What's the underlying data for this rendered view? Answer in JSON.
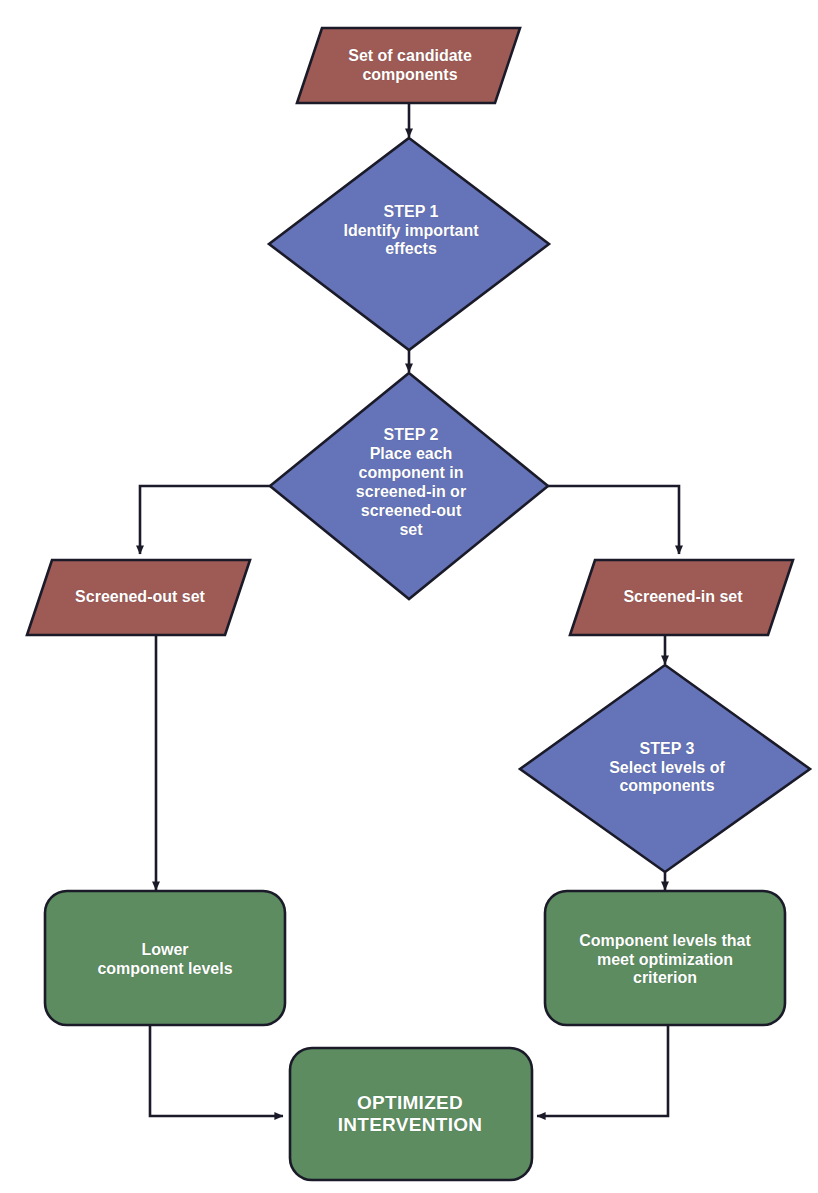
{
  "diagram": {
    "colors": {
      "red_fill": "#9e5a55",
      "blue_fill": "#6573b8",
      "green_fill": "#5c8c60",
      "outline": "#1a1a28",
      "text": "#ffffff",
      "background": "#ffffff"
    },
    "nodes": [
      {
        "id": "candidate-components",
        "shape": "parallelogram",
        "fill": "#9e5a55",
        "label": "Set of candidate\ncomponents"
      },
      {
        "id": "step-1",
        "shape": "diamond",
        "fill": "#6573b8",
        "label": "STEP 1\nIdentify important\neffects"
      },
      {
        "id": "step-2",
        "shape": "diamond",
        "fill": "#6573b8",
        "label": "STEP 2\nPlace each\ncomponent in\nscreened-in or\nscreened-out\nset"
      },
      {
        "id": "screened-out-set",
        "shape": "parallelogram",
        "fill": "#9e5a55",
        "label": "Screened-out set"
      },
      {
        "id": "screened-in-set",
        "shape": "parallelogram",
        "fill": "#9e5a55",
        "label": "Screened-in set"
      },
      {
        "id": "step-3",
        "shape": "diamond",
        "fill": "#6573b8",
        "label": "STEP 3\nSelect levels of\ncomponents"
      },
      {
        "id": "lower-component-levels",
        "shape": "rounded-rectangle",
        "fill": "#5c8c60",
        "label": "Lower\ncomponent levels"
      },
      {
        "id": "component-levels-meet-criterion",
        "shape": "rounded-rectangle",
        "fill": "#5c8c60",
        "label": "Component levels that\nmeet optimization\ncriterion"
      },
      {
        "id": "optimized-intervention",
        "shape": "rounded-rectangle",
        "fill": "#5c8c60",
        "label": "OPTIMIZED\nINTERVENTION"
      }
    ],
    "edges": [
      {
        "id": "edge-candidate-to-step1",
        "from": "candidate-components",
        "to": "step-1",
        "style": "straight-down-arrow"
      },
      {
        "id": "edge-step1-to-step2",
        "from": "step-1",
        "to": "step-2",
        "style": "straight-down-arrow"
      },
      {
        "id": "edge-step2-to-screened-out",
        "from": "step-2",
        "to": "screened-out-set",
        "style": "elbow-left-down-arrow"
      },
      {
        "id": "edge-step2-to-screened-in",
        "from": "step-2",
        "to": "screened-in-set",
        "style": "elbow-right-down-arrow"
      },
      {
        "id": "edge-screened-out-to-lower",
        "from": "screened-out-set",
        "to": "lower-component-levels",
        "style": "straight-down-arrow"
      },
      {
        "id": "edge-screened-in-to-step3",
        "from": "screened-in-set",
        "to": "step-3",
        "style": "straight-down-arrow"
      },
      {
        "id": "edge-step3-to-meet",
        "from": "step-3",
        "to": "component-levels-meet-criterion",
        "style": "straight-down-arrow"
      },
      {
        "id": "edge-lower-to-final",
        "from": "lower-component-levels",
        "to": "optimized-intervention",
        "style": "elbow-down-right-arrow"
      },
      {
        "id": "edge-meet-to-final",
        "from": "component-levels-meet-criterion",
        "to": "optimized-intervention",
        "style": "elbow-down-left-arrow"
      }
    ]
  }
}
